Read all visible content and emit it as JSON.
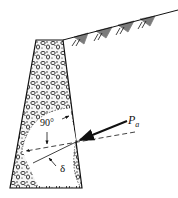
{
  "diagram": {
    "type": "retaining-wall-earth-pressure",
    "labels": {
      "force": "P",
      "force_subscript": "a",
      "angle_normal": "90°",
      "angle_friction": "δ"
    },
    "colors": {
      "line": "#111111",
      "background": "#ffffff",
      "fill_stone": "#f4f4f4"
    }
  }
}
